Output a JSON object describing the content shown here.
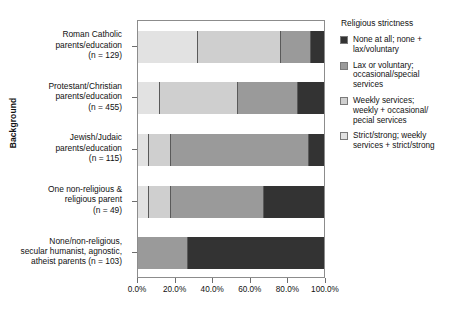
{
  "chart_data": {
    "type": "bar",
    "orientation": "horizontal",
    "stacked": true,
    "stack_mode": "percent",
    "title": "",
    "xlabel": "",
    "ylabel": "Background",
    "xlim": [
      0,
      100
    ],
    "xticks": [
      0,
      20,
      40,
      60,
      80,
      100
    ],
    "xtick_labels": [
      "0.0%",
      "20.0%",
      "40.0%",
      "60.0%",
      "80.0%",
      "100.0%"
    ],
    "grid": false,
    "legend_title": "Religious strictness",
    "legend_position": "right",
    "categories": [
      "Roman Catholic parents/education (n = 129)",
      "Protestant/Christian parents/education (n = 455)",
      "Jewish/Judaic parents/education (n = 115)",
      "One non-religious & religious parent (n = 49)",
      "None/non-religious, secular humanist, agnostic, atheist parents (n = 103)"
    ],
    "series": [
      {
        "name": "Strict/strong; weekly services + strict/strong",
        "color": "#e2e2e2",
        "values": [
          32,
          12,
          6,
          6,
          0
        ]
      },
      {
        "name": "Weekly services; weekly + occasional/pecial services",
        "color": "#cfcfcf",
        "values": [
          45,
          42,
          12,
          12,
          0
        ]
      },
      {
        "name": "Lax or voluntary; occasional/special services",
        "color": "#9a9a9a",
        "values": [
          16,
          32,
          74,
          50,
          27
        ]
      },
      {
        "name": "None at all; none + lax/voluntary",
        "color": "#333333",
        "values": [
          7,
          14,
          8,
          32,
          73
        ]
      }
    ]
  },
  "axis": {
    "y_title": "Background",
    "category_labels": [
      [
        "Roman Catholic",
        "parents/education",
        "(n = 129)"
      ],
      [
        "Protestant/Christian",
        "parents/education",
        "(n = 455)"
      ],
      [
        "Jewish/Judaic",
        "parents/education",
        "(n = 115)"
      ],
      [
        "One non-religious &",
        "religious parent",
        "(n = 49)"
      ],
      [
        "None/non-religious,",
        "secular humanist, agnostic,",
        "atheist parents (n = 103)"
      ]
    ]
  },
  "legend": {
    "title": "Religious strictness",
    "items": [
      {
        "color": "#333333",
        "lines": [
          "None at all; none +",
          "lax/voluntary"
        ]
      },
      {
        "color": "#9a9a9a",
        "lines": [
          "Lax or voluntary;",
          "occasional/special",
          "services"
        ]
      },
      {
        "color": "#cfcfcf",
        "lines": [
          "Weekly services;",
          "weekly + occasional/",
          "pecial services"
        ]
      },
      {
        "color": "#e2e2e2",
        "lines": [
          "Strict/strong; weekly",
          "services + strict/strong"
        ]
      }
    ]
  },
  "colors": {
    "none_at_all": "#333333",
    "lax_or_voluntary": "#9a9a9a",
    "weekly_services": "#cfcfcf",
    "strict_strong": "#e2e2e2",
    "frame": "#8c8c8c",
    "text": "#111111"
  }
}
